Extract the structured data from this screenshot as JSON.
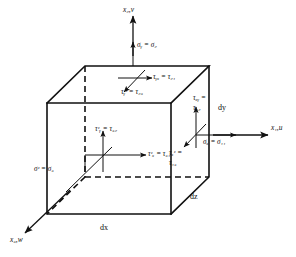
{
  "figure": {
    "background_color": "#ffffff",
    "line_color": "#111111"
  },
  "axes": [
    {
      "id": "x2",
      "label": "x₂,v",
      "description": "vertical axis upward"
    },
    {
      "id": "x1",
      "label": "x₁,u",
      "description": "horizontal axis to the right"
    },
    {
      "id": "x3",
      "label": "x₃,w",
      "description": "oblique axis to lower left"
    }
  ],
  "dimensions": [
    {
      "id": "dx",
      "label": "dx"
    },
    {
      "id": "dy",
      "label": "dy"
    },
    {
      "id": "dz",
      "label": "dz"
    }
  ],
  "normal_stresses": [
    {
      "id": "sigma-y",
      "label": "σᵧ = σ₂",
      "face": "top"
    },
    {
      "id": "sigma-x",
      "label": "σₓ = σ₁₁",
      "face": "right"
    },
    {
      "id": "sigma-z",
      "label": "σᶻ = σ₃",
      "face": "front"
    }
  ],
  "shear_stresses": [
    {
      "id": "tau-yx",
      "label": "τᵧₓ = τ₂₁",
      "face": "top"
    },
    {
      "id": "tau-yz",
      "label": "τᵧᶻ = τ₂₃",
      "face": "top"
    },
    {
      "id": "tau-xy",
      "line1": "τₓᵧ =",
      "line2": "τ₁₂",
      "face": "right"
    },
    {
      "id": "tau-xz",
      "line1": "τₓᶻ =",
      "line2": "τ₁₃",
      "face": "right"
    },
    {
      "id": "tau-zy",
      "label": "τᶻᵧ = τ₃₂",
      "face": "front"
    },
    {
      "id": "tau-zx",
      "label": "τᶻₓ = τ₃₁",
      "face": "front"
    }
  ]
}
